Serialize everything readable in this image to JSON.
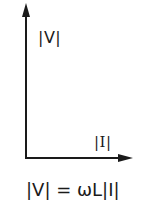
{
  "diagram": {
    "type": "phasor-diagram",
    "vertical_axis": {
      "label": "|V|",
      "direction": "up"
    },
    "horizontal_axis": {
      "label": "|I|",
      "direction": "right"
    },
    "equation": "|V| = ωL|I|",
    "colors": {
      "ink": "#1a1a1a",
      "background": "#ffffff"
    }
  }
}
